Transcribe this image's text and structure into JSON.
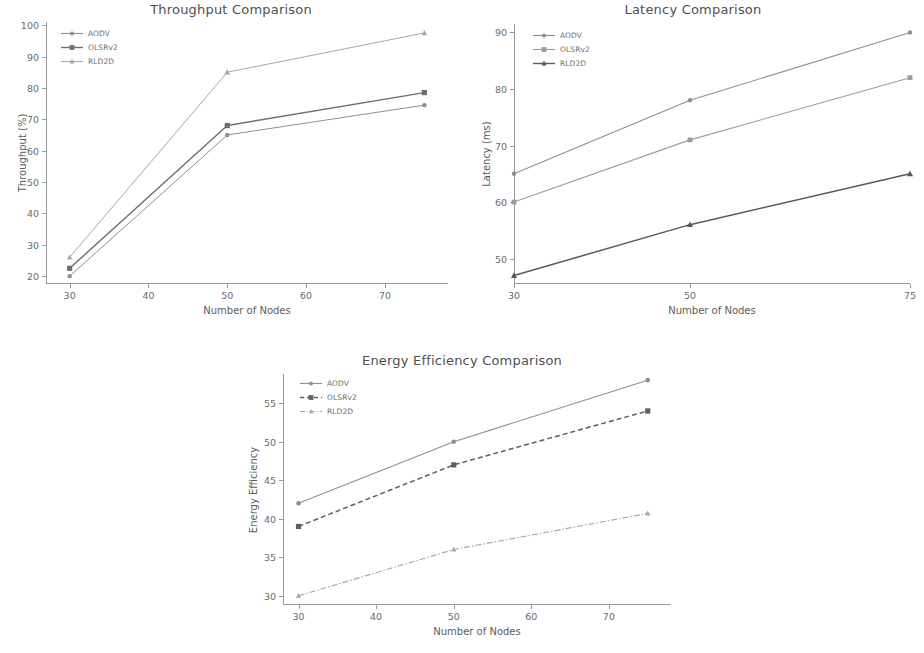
{
  "figure": {
    "series_names": [
      "AODV",
      "OLSRv2",
      "RLD2D"
    ],
    "colors": {
      "aodv": "#8f8f8f",
      "olsrv2": "#6e6e6e",
      "rld2d": "#a8a8a8",
      "axis": "#9a9a9a",
      "text": "#5c5c5c"
    }
  },
  "chart_data": [
    {
      "id": "throughput",
      "type": "line",
      "title": "Throughput Comparison",
      "xlabel": "Number of Nodes",
      "ylabel": "Throughput (%)",
      "x": [
        30,
        50,
        75
      ],
      "xticks": [
        30,
        40,
        50,
        60,
        70
      ],
      "yticks": [
        20,
        30,
        40,
        50,
        60,
        70,
        80,
        90,
        100
      ],
      "xlim": [
        27,
        78
      ],
      "ylim": [
        17.5,
        101
      ],
      "grid": false,
      "legend_position": "upper left",
      "series": [
        {
          "name": "AODV",
          "values": [
            20,
            65,
            74.5
          ],
          "marker": "circle",
          "linestyle": "solid"
        },
        {
          "name": "OLSRv2",
          "values": [
            22.5,
            68,
            78.5
          ],
          "marker": "square",
          "linestyle": "solid"
        },
        {
          "name": "RLD2D",
          "values": [
            26,
            85,
            97.5
          ],
          "marker": "triangle",
          "linestyle": "solid"
        }
      ]
    },
    {
      "id": "latency",
      "type": "line",
      "title": "Latency Comparison",
      "xlabel": "Number of Nodes",
      "ylabel": "Latency (ms)",
      "x": [
        30,
        50,
        75
      ],
      "xticks": [
        30,
        50,
        75
      ],
      "yticks": [
        50,
        60,
        70,
        80,
        90
      ],
      "xlim": [
        30,
        75
      ],
      "ylim": [
        45.5,
        91.5
      ],
      "grid": false,
      "legend_position": "upper left",
      "series": [
        {
          "name": "AODV",
          "values": [
            65,
            78,
            90
          ],
          "marker": "circle",
          "linestyle": "solid"
        },
        {
          "name": "OLSRv2",
          "values": [
            60,
            71,
            82
          ],
          "marker": "square",
          "linestyle": "solid"
        },
        {
          "name": "RLD2D",
          "values": [
            47,
            56,
            65
          ],
          "marker": "triangle",
          "linestyle": "solid"
        }
      ]
    },
    {
      "id": "energy",
      "type": "line",
      "title": "Energy Efficiency Comparison",
      "xlabel": "Number of Nodes",
      "ylabel": "Energy Efficiency",
      "x": [
        30,
        50,
        75
      ],
      "xticks": [
        30,
        40,
        50,
        60,
        70
      ],
      "yticks": [
        30,
        35,
        40,
        45,
        50,
        55
      ],
      "xlim": [
        28,
        78
      ],
      "ylim": [
        28.8,
        58.8
      ],
      "grid": false,
      "legend_position": "upper left",
      "series": [
        {
          "name": "AODV",
          "values": [
            42,
            50,
            58
          ],
          "marker": "circle",
          "linestyle": "solid"
        },
        {
          "name": "OLSRv2",
          "values": [
            39,
            47,
            54
          ],
          "marker": "square",
          "linestyle": "dashed"
        },
        {
          "name": "RLD2D",
          "values": [
            30,
            36,
            40.7
          ],
          "marker": "triangle",
          "linestyle": "dashdot"
        }
      ]
    }
  ]
}
